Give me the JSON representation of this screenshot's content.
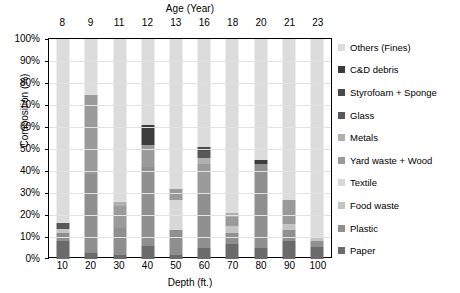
{
  "chart_data": {
    "type": "bar",
    "title": "",
    "subtitle": "",
    "stacked": true,
    "normalized_percent": true,
    "xlabel": "Depth (ft.)",
    "ylabel": "Composition (%)",
    "secondary_xlabel": "Age (Year)",
    "categories": [
      "10",
      "20",
      "30",
      "40",
      "50",
      "60",
      "70",
      "80",
      "90",
      "100"
    ],
    "secondary_categories": [
      "8",
      "9",
      "11",
      "12",
      "13",
      "16",
      "18",
      "20",
      "21",
      "23"
    ],
    "ylim": [
      0,
      100
    ],
    "ytick_labels": [
      "0%",
      "10%",
      "20%",
      "30%",
      "40%",
      "50%",
      "60%",
      "70%",
      "80%",
      "90%",
      "100%"
    ],
    "ytick_values": [
      0,
      10,
      20,
      30,
      40,
      50,
      60,
      70,
      80,
      90,
      100
    ],
    "grid": true,
    "legend_position": "right",
    "series": [
      {
        "name": "Paper",
        "color": "#6b6b6b",
        "values": [
          8.0,
          2.5,
          2.0,
          6.0,
          2.0,
          5.0,
          7.0,
          5.0,
          8.0,
          5.5
        ]
      },
      {
        "name": "Plastic",
        "color": "#8f8f8f",
        "values": [
          4.0,
          36.0,
          12.0,
          36.0,
          11.0,
          25.0,
          5.0,
          38.0,
          5.0,
          2.5
        ]
      },
      {
        "name": "Food waste",
        "color": "#c4c4c4",
        "values": [
          1.5,
          0.0,
          0.0,
          0.0,
          0.0,
          0.0,
          3.0,
          0.0,
          3.0,
          1.5
        ]
      },
      {
        "name": "Textile",
        "color": "#d8d8d8",
        "values": [
          0.0,
          0.0,
          0.0,
          0.0,
          14.0,
          0.0,
          0.0,
          0.0,
          0.0,
          0.0
        ]
      },
      {
        "name": "Yard waste + Wood",
        "color": "#9a9a9a",
        "values": [
          0.0,
          36.0,
          10.0,
          10.0,
          5.0,
          13.0,
          4.0,
          0.0,
          11.0,
          0.0
        ]
      },
      {
        "name": "Metals",
        "color": "#b0b0b0",
        "values": [
          0.0,
          0.0,
          2.0,
          0.0,
          0.0,
          3.0,
          2.0,
          0.0,
          0.0,
          0.0
        ]
      },
      {
        "name": "Glass",
        "color": "#585858",
        "values": [
          3.0,
          0.0,
          0.0,
          0.0,
          0.0,
          3.0,
          0.0,
          0.0,
          0.0,
          0.0
        ]
      },
      {
        "name": "Styrofoam + Sponge",
        "color": "#4a4a4a",
        "values": [
          0.0,
          0.0,
          0.0,
          0.0,
          0.0,
          2.0,
          0.0,
          0.0,
          0.0,
          0.0
        ]
      },
      {
        "name": "C&D debris",
        "color": "#3c3c3c",
        "values": [
          0.0,
          0.0,
          0.0,
          9.0,
          0.0,
          0.0,
          0.0,
          2.0,
          0.0,
          0.0
        ]
      },
      {
        "name": "Others (Fines)",
        "color": "#dcdcdc",
        "values": [
          83.5,
          25.5,
          74.0,
          39.0,
          68.0,
          49.0,
          79.0,
          55.0,
          73.0,
          90.5
        ]
      }
    ]
  },
  "axes": {
    "top_title": "Age (Year)",
    "bottom_title": "Depth (ft.)",
    "left_title": "Composition (%)"
  },
  "legend": {
    "items": [
      {
        "label": "Others (Fines)",
        "color": "#dcdcdc"
      },
      {
        "label": "C&D debris",
        "color": "#3c3c3c"
      },
      {
        "label": "Styrofoam + Sponge",
        "color": "#4a4a4a"
      },
      {
        "label": "Glass",
        "color": "#585858"
      },
      {
        "label": "Metals",
        "color": "#b0b0b0"
      },
      {
        "label": "Yard waste + Wood",
        "color": "#9a9a9a"
      },
      {
        "label": "Textile",
        "color": "#d8d8d8"
      },
      {
        "label": "Food waste",
        "color": "#c4c4c4"
      },
      {
        "label": "Plastic",
        "color": "#8f8f8f"
      },
      {
        "label": "Paper",
        "color": "#6b6b6b"
      }
    ]
  }
}
